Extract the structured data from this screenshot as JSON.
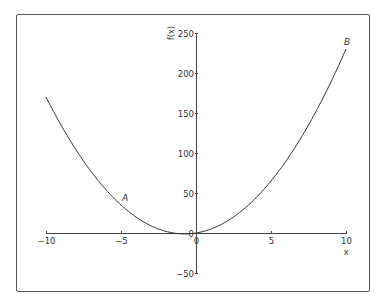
{
  "chart_data": {
    "type": "line",
    "title": "",
    "function": "f(x) = 2x^2 + 3x",
    "xlabel": "x",
    "ylabel": "f(x)",
    "xlim": [
      -10,
      10
    ],
    "ylim": [
      -50,
      250
    ],
    "x_ticks": [
      -10,
      -5,
      0,
      5,
      10
    ],
    "x_tick_labels": [
      "−10",
      "−5",
      "0",
      "5",
      "10"
    ],
    "y_ticks": [
      -50,
      0,
      50,
      100,
      150,
      200,
      250
    ],
    "y_tick_labels": [
      "−50",
      "0",
      "50",
      "100",
      "150",
      "200",
      "250"
    ],
    "grid": false,
    "legend": null,
    "series": [
      {
        "name": "f(x)",
        "x": [
          -10,
          -8,
          -6,
          -5,
          -4,
          -2,
          -1,
          -0.75,
          0,
          2,
          4,
          5,
          6,
          8,
          10
        ],
        "y": [
          170,
          104,
          54,
          35,
          20,
          2,
          -1,
          -1.125,
          0,
          14,
          44,
          65,
          90,
          152,
          230
        ]
      }
    ],
    "annotations": [
      {
        "text": "A",
        "x": -5,
        "y": 35
      },
      {
        "text": "B",
        "x": 10,
        "y": 230
      }
    ]
  },
  "labels": {
    "xlabel": "x",
    "ylabel": "f(x)",
    "point_a": "A",
    "point_b": "B"
  },
  "colors": {
    "line": "#333333",
    "axis": "#444444",
    "frame": "#555555"
  }
}
